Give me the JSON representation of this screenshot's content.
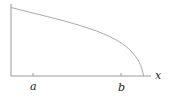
{
  "diagram": {
    "type": "function-graph",
    "labels": {
      "x_axis": "x",
      "tick_a": "a",
      "tick_b": "b"
    },
    "colors": {
      "axis": "#9a9a9a",
      "curve": "#a8a8a8",
      "text": "#222222"
    }
  }
}
